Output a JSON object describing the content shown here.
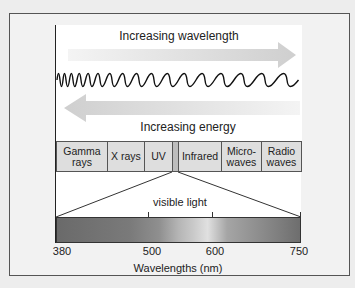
{
  "diagram": {
    "title_top": "Increasing wavelength",
    "title_bottom": "Increasing energy",
    "bands": [
      {
        "label_1": "Gamma",
        "label_2": "rays"
      },
      {
        "label_1": "X rays",
        "label_2": ""
      },
      {
        "label_1": "UV",
        "label_2": ""
      },
      {
        "label_1": "",
        "label_2": ""
      },
      {
        "label_1": "Infrared",
        "label_2": ""
      },
      {
        "label_1": "Micro-",
        "label_2": "waves"
      },
      {
        "label_1": "Radio",
        "label_2": "waves"
      }
    ],
    "visible_label": "visible light",
    "axis": {
      "ticks": [
        "380",
        "500",
        "600",
        "750"
      ],
      "label": "Wavelengths (nm)"
    },
    "colors": {
      "arrow": "#d4d4d4",
      "wave": "#111111",
      "band_fill": "#dedede",
      "frame_border": "#555555"
    }
  }
}
